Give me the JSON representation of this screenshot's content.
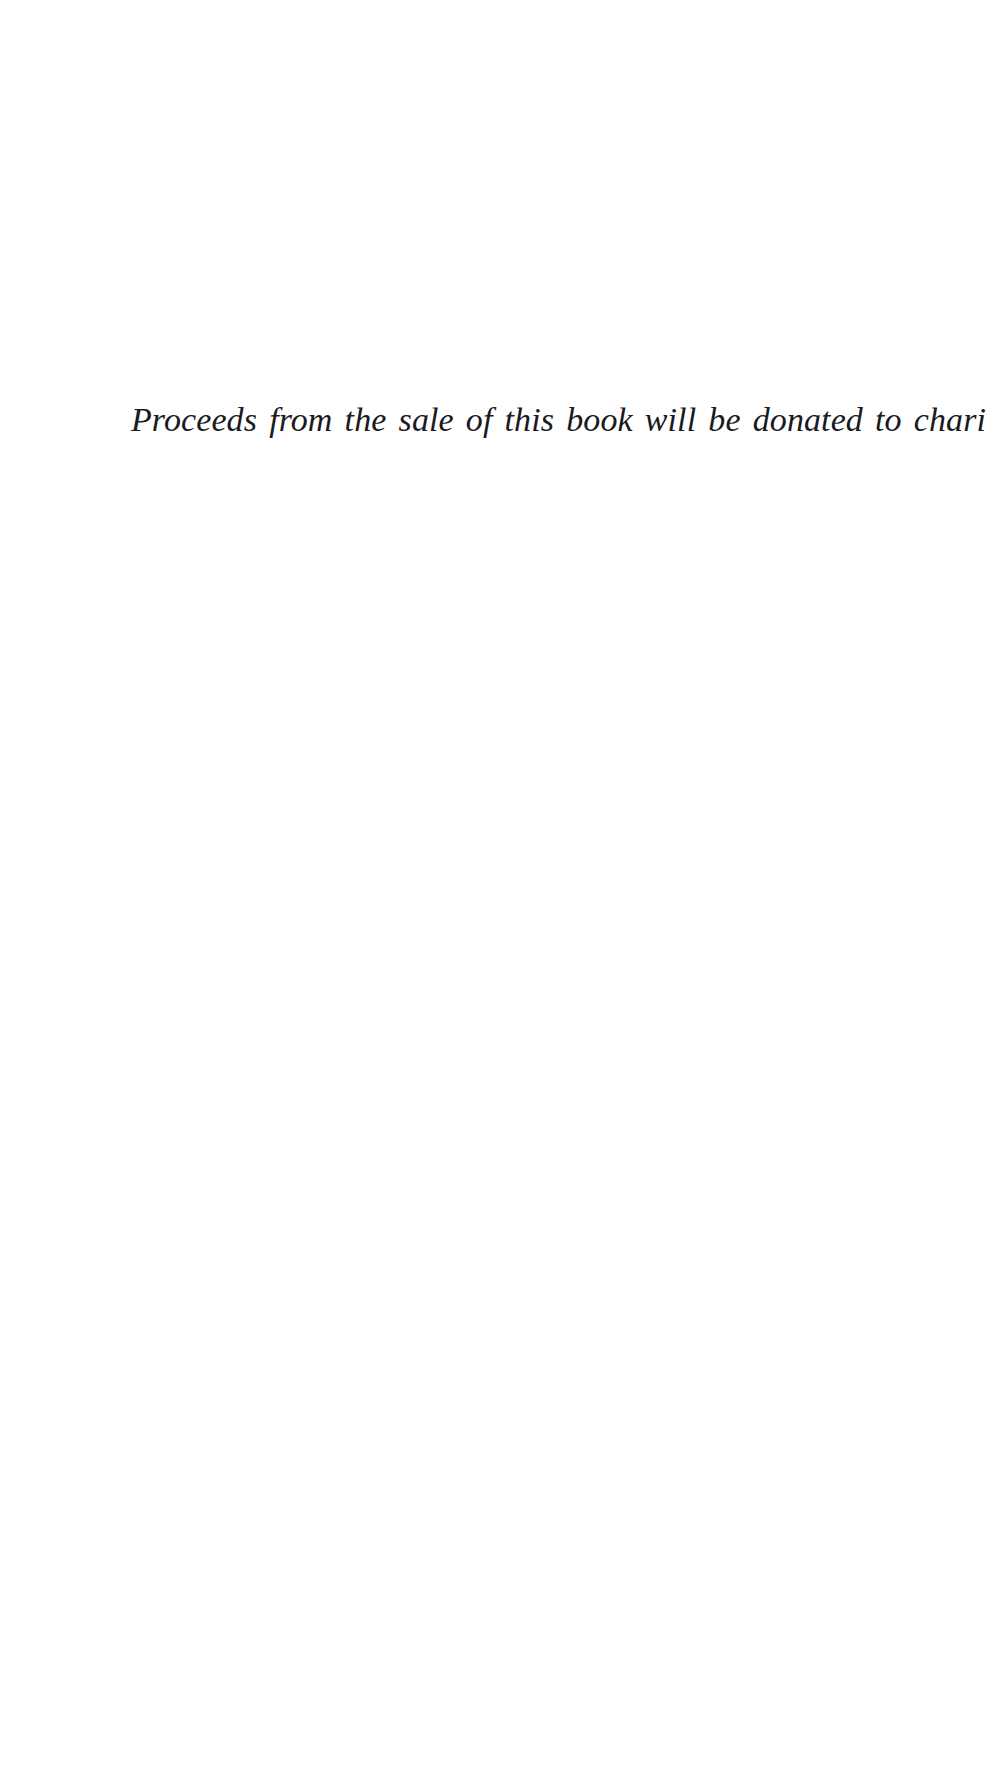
{
  "page": {
    "background_color": "#ffffff",
    "width": 987,
    "height": 1767,
    "ink_color": "#1a1a22"
  },
  "content": {
    "charity_note": "Proceeds from the sale of this book will be donated to charity"
  },
  "blank_regions": {
    "top_label": "",
    "bottom_label": ""
  }
}
